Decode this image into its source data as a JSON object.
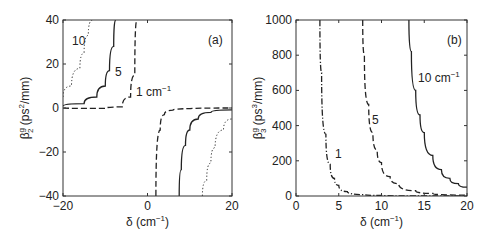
{
  "chart_data": [
    {
      "type": "line",
      "panel_label": "(a)",
      "xlabel": "δ (cm⁻¹)",
      "ylabel": "β₂ᵍ (ps²/mm)",
      "xlim": [
        -20,
        20
      ],
      "ylim": [
        -40,
        40
      ],
      "xticks": [
        -20,
        0,
        20
      ],
      "yticks": [
        -40,
        -20,
        0,
        20,
        40
      ],
      "grid": false,
      "series": [
        {
          "name": "1 cm⁻¹",
          "style": "dashed",
          "label": "1 cm⁻¹",
          "x": [
            -20,
            -10,
            -6,
            -4,
            -3,
            -2.5,
            2,
            3,
            4,
            6,
            10,
            20
          ],
          "y": [
            0,
            -0.2,
            0.5,
            5,
            15,
            40,
            -40,
            -10,
            -3,
            -1,
            -0.3,
            0
          ]
        },
        {
          "name": "5 cm⁻¹",
          "style": "solid",
          "label": "5",
          "x": [
            -20,
            -15,
            -12,
            -10,
            -9,
            -8,
            -7.5,
            7.5,
            8,
            9,
            10,
            12,
            15,
            20
          ],
          "y": [
            0.8,
            2,
            5,
            10,
            17,
            28,
            40,
            -40,
            -28,
            -17,
            -10,
            -5,
            -2,
            -0.8
          ]
        },
        {
          "name": "10 cm⁻¹",
          "style": "dotted",
          "label": "10",
          "x": [
            -20,
            -18,
            -16,
            -15,
            -14,
            -13,
            13,
            14,
            15,
            16,
            18,
            20
          ],
          "y": [
            5,
            10,
            18,
            25,
            33,
            40,
            -40,
            -33,
            -25,
            -18,
            -10,
            -5
          ]
        }
      ]
    },
    {
      "type": "line",
      "panel_label": "(b)",
      "xlabel": "δ (cm⁻¹)",
      "ylabel": "β₃ᵍ (ps³/mm)",
      "xlim": [
        0,
        20
      ],
      "ylim": [
        0,
        1000
      ],
      "xticks": [
        0,
        5,
        10,
        15,
        20
      ],
      "yticks": [
        0,
        200,
        400,
        600,
        800,
        1000
      ],
      "grid": false,
      "series": [
        {
          "name": "1 cm⁻¹",
          "style": "dashdot",
          "label": "1",
          "x": [
            2.8,
            3,
            3.5,
            4,
            4.5,
            5,
            6,
            8,
            10,
            20
          ],
          "y": [
            1000,
            700,
            350,
            180,
            100,
            60,
            25,
            8,
            3,
            0
          ]
        },
        {
          "name": "5 cm⁻¹",
          "style": "dashed",
          "label": "5",
          "x": [
            7.8,
            8,
            8.5,
            9,
            9.5,
            10,
            11,
            12,
            14,
            16,
            20
          ],
          "y": [
            1000,
            800,
            520,
            360,
            260,
            190,
            110,
            70,
            30,
            15,
            5
          ]
        },
        {
          "name": "10 cm⁻¹",
          "style": "solid",
          "label": "10 cm⁻¹",
          "x": [
            13.2,
            13.5,
            14,
            14.5,
            15,
            16,
            17,
            18,
            19,
            20
          ],
          "y": [
            1000,
            820,
            600,
            460,
            360,
            230,
            150,
            100,
            70,
            50
          ]
        }
      ]
    }
  ]
}
